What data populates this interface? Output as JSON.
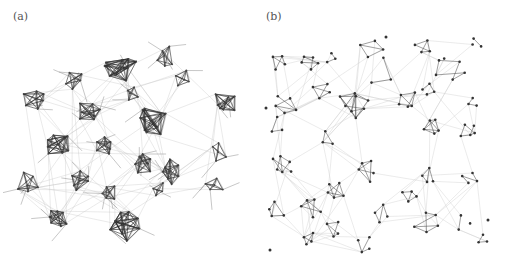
{
  "figure": {
    "panels": [
      {
        "id": "a",
        "label": "(a)",
        "description": "Clustered network layout with dense cliques",
        "style": {
          "clique_edge": "#2a2a2a",
          "inter_edge": "#bdbdbd",
          "node": "#444444"
        },
        "clusters": [
          {
            "cx": 120,
            "cy": 68,
            "r": 17,
            "n": 9
          },
          {
            "cx": 165,
            "cy": 57,
            "r": 12,
            "n": 5
          },
          {
            "cx": 74,
            "cy": 78,
            "r": 11,
            "n": 5
          },
          {
            "cx": 184,
            "cy": 79,
            "r": 10,
            "n": 4
          },
          {
            "cx": 36,
            "cy": 98,
            "r": 13,
            "n": 6
          },
          {
            "cx": 89,
            "cy": 112,
            "r": 13,
            "n": 7
          },
          {
            "cx": 131,
            "cy": 93,
            "r": 8,
            "n": 4
          },
          {
            "cx": 151,
            "cy": 122,
            "r": 17,
            "n": 9
          },
          {
            "cx": 224,
            "cy": 104,
            "r": 13,
            "n": 7
          },
          {
            "cx": 58,
            "cy": 144,
            "r": 15,
            "n": 8
          },
          {
            "cx": 105,
            "cy": 145,
            "r": 12,
            "n": 6
          },
          {
            "cx": 143,
            "cy": 161,
            "r": 13,
            "n": 7
          },
          {
            "cx": 170,
            "cy": 172,
            "r": 14,
            "n": 7
          },
          {
            "cx": 217,
            "cy": 151,
            "r": 12,
            "n": 4
          },
          {
            "cx": 28,
            "cy": 184,
            "r": 13,
            "n": 5
          },
          {
            "cx": 79,
            "cy": 180,
            "r": 12,
            "n": 6
          },
          {
            "cx": 108,
            "cy": 193,
            "r": 12,
            "n": 5
          },
          {
            "cx": 214,
            "cy": 185,
            "r": 11,
            "n": 4
          },
          {
            "cx": 57,
            "cy": 218,
            "r": 14,
            "n": 7
          },
          {
            "cx": 123,
            "cy": 225,
            "r": 17,
            "n": 9
          },
          {
            "cx": 158,
            "cy": 190,
            "r": 9,
            "n": 4
          }
        ]
      },
      {
        "id": "b",
        "label": "(b)",
        "description": "Spread network layout with sparse local groups",
        "style": {
          "group_edge": "#555555",
          "inter_edge": "#cfcfcf",
          "node": "#333333"
        },
        "clusters": [
          {
            "cx": 28,
            "cy": 62,
            "r": 10,
            "n": 4
          },
          {
            "cx": 58,
            "cy": 62,
            "r": 9,
            "n": 5
          },
          {
            "cx": 80,
            "cy": 58,
            "r": 6,
            "n": 3
          },
          {
            "cx": 118,
            "cy": 48,
            "r": 14,
            "n": 4
          },
          {
            "cx": 172,
            "cy": 48,
            "r": 10,
            "n": 4
          },
          {
            "cx": 224,
            "cy": 43,
            "r": 6,
            "n": 3
          },
          {
            "cx": 130,
            "cy": 74,
            "r": 18,
            "n": 3
          },
          {
            "cx": 198,
            "cy": 70,
            "r": 16,
            "n": 6
          },
          {
            "cx": 35,
            "cy": 104,
            "r": 12,
            "n": 5
          },
          {
            "cx": 70,
            "cy": 90,
            "r": 11,
            "n": 4
          },
          {
            "cx": 103,
            "cy": 104,
            "r": 16,
            "n": 8
          },
          {
            "cx": 154,
            "cy": 100,
            "r": 12,
            "n": 5
          },
          {
            "cx": 176,
            "cy": 90,
            "r": 9,
            "n": 4
          },
          {
            "cx": 220,
            "cy": 102,
            "r": 7,
            "n": 3
          },
          {
            "cx": 25,
            "cy": 127,
            "r": 10,
            "n": 3
          },
          {
            "cx": 75,
            "cy": 140,
            "r": 9,
            "n": 3
          },
          {
            "cx": 180,
            "cy": 125,
            "r": 10,
            "n": 5
          },
          {
            "cx": 218,
            "cy": 130,
            "r": 11,
            "n": 5
          },
          {
            "cx": 32,
            "cy": 165,
            "r": 14,
            "n": 6
          },
          {
            "cx": 116,
            "cy": 168,
            "r": 16,
            "n": 5
          },
          {
            "cx": 176,
            "cy": 177,
            "r": 11,
            "n": 4
          },
          {
            "cx": 220,
            "cy": 178,
            "r": 11,
            "n": 4
          },
          {
            "cx": 22,
            "cy": 212,
            "r": 10,
            "n": 4
          },
          {
            "cx": 60,
            "cy": 205,
            "r": 12,
            "n": 5
          },
          {
            "cx": 84,
            "cy": 192,
            "r": 10,
            "n": 5
          },
          {
            "cx": 158,
            "cy": 196,
            "r": 9,
            "n": 4
          },
          {
            "cx": 130,
            "cy": 213,
            "r": 12,
            "n": 4
          },
          {
            "cx": 176,
            "cy": 222,
            "r": 14,
            "n": 5
          },
          {
            "cx": 212,
            "cy": 222,
            "r": 10,
            "n": 3
          },
          {
            "cx": 55,
            "cy": 240,
            "r": 9,
            "n": 4
          },
          {
            "cx": 82,
            "cy": 230,
            "r": 10,
            "n": 4
          },
          {
            "cx": 112,
            "cy": 245,
            "r": 10,
            "n": 4
          },
          {
            "cx": 230,
            "cy": 240,
            "r": 7,
            "n": 3
          }
        ],
        "isolated_nodes": [
          {
            "x": 134,
            "y": 37
          },
          {
            "x": 18,
            "y": 250
          },
          {
            "x": 236,
            "y": 220
          },
          {
            "x": 14,
            "y": 108
          }
        ]
      }
    ]
  }
}
